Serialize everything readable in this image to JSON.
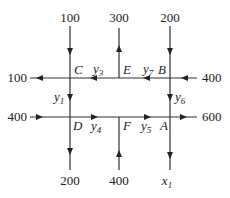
{
  "diagram": {
    "type": "traffic-flow-network",
    "nodes": {
      "C": "C",
      "E": "E",
      "B": "B",
      "D": "D",
      "F": "F",
      "A": "A"
    },
    "external_flows": {
      "top_left_in": "100",
      "top_middle_out": "300",
      "top_right_in": "200",
      "left_top_out": "100",
      "right_top_in": "400",
      "left_bottom_in": "400",
      "right_bottom_out": "600",
      "bottom_left_out": "200",
      "bottom_middle_in": "400",
      "bottom_right_out_var": "x",
      "bottom_right_out_sub": "1"
    },
    "internal_flows": {
      "y1": {
        "var": "y",
        "sub": "1"
      },
      "y3": {
        "var": "y",
        "sub": "3"
      },
      "y4": {
        "var": "y",
        "sub": "4"
      },
      "y5": {
        "var": "y",
        "sub": "5"
      },
      "y6": {
        "var": "y",
        "sub": "6"
      },
      "y7": {
        "var": "y",
        "sub": "7"
      }
    }
  }
}
